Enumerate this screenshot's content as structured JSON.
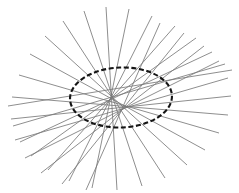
{
  "figure": {
    "type": "geometric-envelope-diagram",
    "background_color": "#ffffff",
    "canvas": {
      "width": 239,
      "height": 193
    }
  },
  "chart_data": {
    "type": "scatter",
    "subtitle": "",
    "xlabel": "",
    "ylabel": "",
    "xlim": [
      0,
      239
    ],
    "ylim": [
      0,
      193
    ],
    "grid": false,
    "legend": null,
    "axes_visible": false,
    "tick_labels_x": [],
    "tick_labels_y": [],
    "annotations": [],
    "ellipse": {
      "name": "envelope-ellipse",
      "center_x": 121,
      "center_y": 97.5,
      "semi_major_axis": 51,
      "semi_minor_axis": 30,
      "rotation_deg": -2,
      "stroke_color": "#151515",
      "stroke_width": 2.1,
      "dash_pattern": "5 2.6",
      "fill": "none"
    },
    "tangent_lines": {
      "count": 20,
      "stroke_color": "#7a7a7a",
      "stroke_width": 0.85,
      "description": "Straight chords each tangent to the central ellipse, tangency parameters spread around the full ellipse, extended beyond the point of contact.",
      "segments": [
        {
          "x1": 8,
          "y1": 106,
          "x2": 232,
          "y2": 70
        },
        {
          "x1": 13,
          "y1": 126,
          "x2": 225,
          "y2": 64
        },
        {
          "x1": 20,
          "y1": 142,
          "x2": 212,
          "y2": 52
        },
        {
          "x1": 31,
          "y1": 156,
          "x2": 196,
          "y2": 38
        },
        {
          "x1": 48,
          "y1": 170,
          "x2": 175,
          "y2": 26
        },
        {
          "x1": 69,
          "y1": 181,
          "x2": 152,
          "y2": 16
        },
        {
          "x1": 92,
          "y1": 188,
          "x2": 129,
          "y2": 9
        },
        {
          "x1": 117,
          "y1": 190,
          "x2": 106,
          "y2": 7
        },
        {
          "x1": 142,
          "y1": 186,
          "x2": 84,
          "y2": 11
        },
        {
          "x1": 165,
          "y1": 178,
          "x2": 63,
          "y2": 21
        },
        {
          "x1": 187,
          "y1": 165,
          "x2": 45,
          "y2": 36
        },
        {
          "x1": 205,
          "y1": 150,
          "x2": 30,
          "y2": 54
        },
        {
          "x1": 219,
          "y1": 133,
          "x2": 19,
          "y2": 75
        },
        {
          "x1": 228,
          "y1": 115,
          "x2": 12,
          "y2": 97
        },
        {
          "x1": 231,
          "y1": 96,
          "x2": 11,
          "y2": 119
        },
        {
          "x1": 228,
          "y1": 78,
          "x2": 15,
          "y2": 140
        },
        {
          "x1": 219,
          "y1": 61,
          "x2": 25,
          "y2": 158
        },
        {
          "x1": 204,
          "y1": 46,
          "x2": 41,
          "y2": 173
        },
        {
          "x1": 184,
          "y1": 33,
          "x2": 62,
          "y2": 184
        },
        {
          "x1": 160,
          "y1": 23,
          "x2": 86,
          "y2": 190
        }
      ]
    }
  }
}
